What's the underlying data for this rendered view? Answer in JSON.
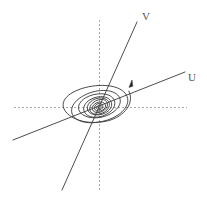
{
  "figure": {
    "width": 207,
    "height": 207,
    "background_color": "#ffffff"
  },
  "labels": {
    "v_label": "V",
    "u_label": "U"
  },
  "colors": {
    "axis": "#a9a9a9",
    "eigen_line": "#4d4d4d",
    "spiral": "#3f3f3f",
    "arrow": "#2b2b2b",
    "label_text": "#555555"
  },
  "chart_data": {
    "type": "line",
    "xlabel": "",
    "ylabel": "",
    "grid": false,
    "legend_position": "none",
    "origin": {
      "x": 99,
      "y": 107
    },
    "axes": [
      {
        "name": "horizontal-axis",
        "style": "dashed",
        "color": "#a9a9a9",
        "x1": 14,
        "y1": 107,
        "x2": 187,
        "y2": 107
      },
      {
        "name": "vertical-axis",
        "style": "dashed",
        "color": "#a9a9a9",
        "x1": 99,
        "y1": 20,
        "x2": 99,
        "y2": 190
      }
    ],
    "series": [
      {
        "name": "U",
        "type": "line",
        "label": "U",
        "label_position": {
          "x": 191,
          "y": 78
        },
        "x1": 13,
        "y1": 140,
        "x2": 185,
        "y2": 72,
        "slope": -0.395
      },
      {
        "name": "V",
        "type": "line",
        "label": "V",
        "label_position": {
          "x": 145,
          "y": 17
        },
        "x1": 62,
        "y1": 190,
        "x2": 137,
        "y2": 22,
        "slope": -2.24
      },
      {
        "name": "spiral-trajectory",
        "type": "spiral",
        "center": {
          "x": 99,
          "y": 107
        },
        "rotation_deg": -28,
        "semi_major_outer": 34,
        "semi_minor_outer": 17,
        "turns": 3.6,
        "direction": "inward-clockwise",
        "arrow_tip": {
          "x": 132,
          "y": 80
        },
        "arrow_angle_deg": -25
      }
    ]
  }
}
